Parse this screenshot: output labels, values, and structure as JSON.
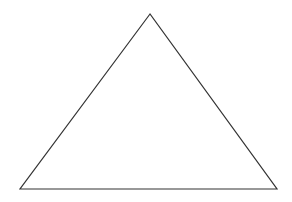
{
  "diagram": {
    "shape": "triangle",
    "vertices": [
      [
        150,
        14
      ],
      [
        20,
        189
      ],
      [
        277,
        189
      ]
    ],
    "stroke": "#333333",
    "stroke_width": 1.2,
    "fill": "none",
    "background": "#ffffff"
  }
}
